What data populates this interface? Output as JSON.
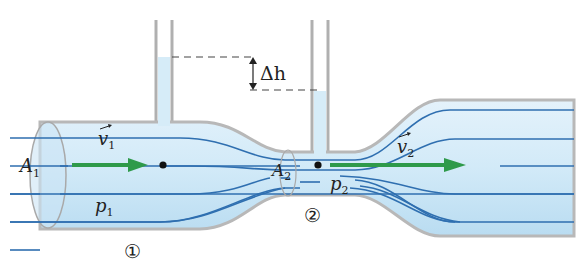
{
  "diagram": {
    "labels": {
      "delta_h": "Δh",
      "A1": "A",
      "A1_sub": "1",
      "A2": "A",
      "A2_sub": "2",
      "v1": "v",
      "v1_sub": "1",
      "v2": "v",
      "v2_sub": "2",
      "p1": "p",
      "p1_sub": "1",
      "p2": "p",
      "p2_sub": "2",
      "section1": "①",
      "section2": "②"
    },
    "colors": {
      "fluid": "#cfe8f6",
      "wall": "#b8b8b8",
      "streamline": "#2f6fb0",
      "velocity_arrow": "#2e9a4a",
      "point": "#111111",
      "dash": "#444444"
    }
  }
}
